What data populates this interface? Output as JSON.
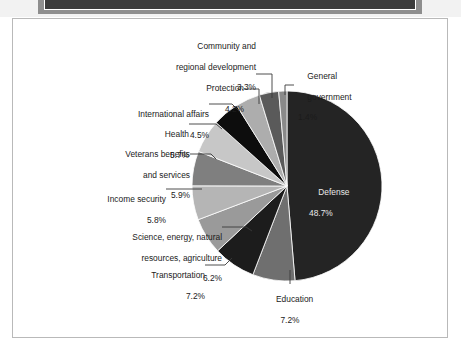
{
  "figure": {
    "background": "#ffffff",
    "border_color": "#b9b9b9"
  },
  "chart_data": {
    "type": "pie",
    "title": "",
    "subtitle": "",
    "xlabel": "",
    "ylabel": "",
    "legend_position": "none",
    "grid": false,
    "units": "percent",
    "start_angle_deg": 0,
    "direction": "clockwise",
    "categories": [
      "Defense",
      "Education",
      "Transportation",
      "Science, energy, natural resources, agriculture",
      "Income security",
      "Veterans benefits and services",
      "Health",
      "International affairs",
      "Protection",
      "Community and regional development",
      "General government"
    ],
    "values": [
      48.7,
      7.2,
      7.2,
      6.2,
      5.8,
      5.9,
      5.7,
      4.5,
      4.2,
      3.3,
      1.4
    ],
    "value_labels": [
      "48.7%",
      "7.2%",
      "7.2%",
      "6.2%",
      "5.8%",
      "5.9%",
      "5.7%",
      "4.5%",
      "4.2%",
      "3.3%",
      "1.4%"
    ],
    "colors": [
      "#242424",
      "#6f6f6f",
      "#1c1c1c",
      "#9a9a9a",
      "#b5b5b5",
      "#7f7f7f",
      "#c7c7c7",
      "#0d0d0d",
      "#adadad",
      "#5a5a5a",
      "#8a8a8a"
    ],
    "slice_outline": "#ffffff"
  },
  "labels": {
    "defense": {
      "name": "Defense",
      "pct": "48.7%"
    },
    "education": {
      "name": "Education",
      "pct": "7.2%"
    },
    "transportation": {
      "name": "Transportation",
      "pct": "7.2%"
    },
    "science": {
      "name_line1": "Science, energy, natural",
      "name_line2": "resources, agriculture",
      "pct": "6.2%"
    },
    "income_security": {
      "name": "Income security",
      "pct": "5.8%"
    },
    "veterans": {
      "name_line1": "Veterans benefits",
      "name_line2": "and services",
      "pct": "5.9%"
    },
    "health": {
      "name": "Health",
      "pct": "5.7%"
    },
    "international": {
      "name": "International affairs",
      "pct": "4.5%"
    },
    "protection": {
      "name": "Protection",
      "pct": "4.2%"
    },
    "community": {
      "name_line1": "Community and",
      "name_line2": "regional development",
      "pct": "3.3%"
    },
    "general_government": {
      "name_line1": "General",
      "name_line2": "government",
      "pct": "1.4%"
    }
  }
}
